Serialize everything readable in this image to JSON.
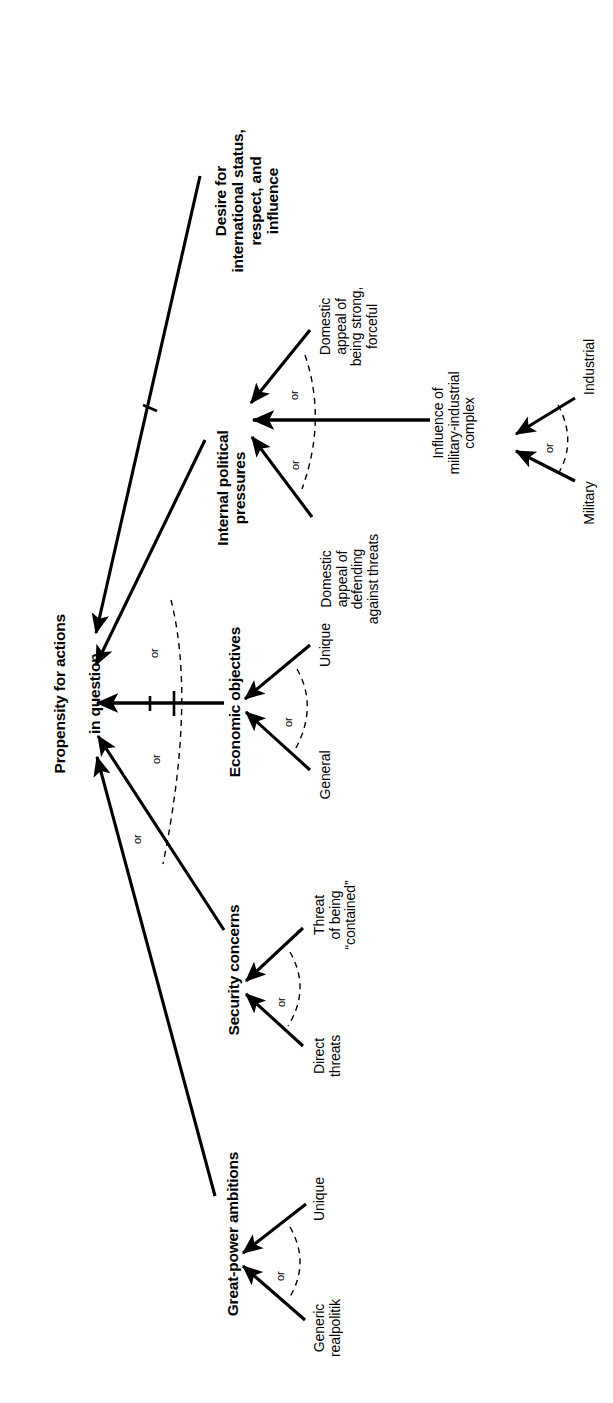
{
  "diagram": {
    "type": "influence-diagram",
    "orientation": "rotated-90-ccw",
    "hub": {
      "label": "Propensity for actions\nin question",
      "line1": "Propensity for actions",
      "line2": "in question"
    },
    "nodes": [
      {
        "id": "great-power-ambitions",
        "title": "Great-power ambitions",
        "children": [
          {
            "id": "unique-gp",
            "label": "Unique"
          },
          {
            "id": "generic-realpolitik",
            "label": "Generic\nrealpolitik"
          }
        ],
        "connector": "or"
      },
      {
        "id": "security-concerns",
        "title": "Security concerns",
        "children": [
          {
            "id": "threat-contained",
            "label": "Threat\nof being\n“contained”"
          },
          {
            "id": "direct-threats",
            "label": "Direct\nthreats"
          }
        ],
        "connector": "or"
      },
      {
        "id": "economic-objectives",
        "title": "Economic objectives",
        "children": [
          {
            "id": "unique-econ",
            "label": "Unique"
          },
          {
            "id": "general-econ",
            "label": "General"
          }
        ],
        "connector": "or"
      },
      {
        "id": "internal-political-pressures",
        "title": "Internal political\npressures",
        "children": [
          {
            "id": "appeal-strong",
            "label": "Domestic\nappeal of\nbeing strong,\nforceful"
          },
          {
            "id": "appeal-defending",
            "label": "Domestic\nappeal of\ndefending\nagainst threats"
          },
          {
            "id": "mic",
            "label": "Influence of\nmilitary-industrial\ncomplex"
          }
        ],
        "connector": "or"
      },
      {
        "id": "military-industrial-complex",
        "title": "Influence of\nmilitary-industrial\ncomplex",
        "children": [
          {
            "id": "industrial",
            "label": "Industrial"
          },
          {
            "id": "military",
            "label": "Military"
          }
        ],
        "connector": "or"
      },
      {
        "id": "desire-status",
        "title": "Desire for\ninternational status,\nrespect, and\ninfluence",
        "children": [],
        "connector": ""
      }
    ],
    "or_markers": [
      {
        "id": "or-hub-upper",
        "text": "or"
      },
      {
        "id": "or-hub-lower",
        "text": "or"
      },
      {
        "id": "or-hub-lowest",
        "text": "or"
      },
      {
        "id": "or-ipp-upper",
        "text": "or"
      },
      {
        "id": "or-ipp-lower",
        "text": "or"
      },
      {
        "id": "or-mic",
        "text": "or"
      },
      {
        "id": "or-econ",
        "text": "or"
      },
      {
        "id": "or-security",
        "text": "or"
      },
      {
        "id": "or-gpa",
        "text": "or"
      }
    ],
    "colors": {
      "background": "#ffffff",
      "ink": "#000000"
    }
  }
}
